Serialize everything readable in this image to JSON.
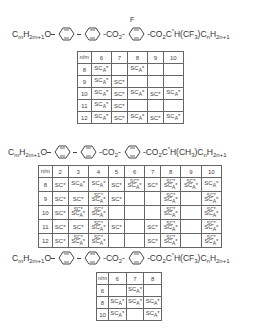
{
  "structures": [
    {
      "id": "compound-1",
      "left_group": "CmH2m+1O",
      "linker": "CO2",
      "lateral_substituent": "F",
      "right_group": "CO2C*H(CF3)CnH2n+1",
      "rings": [
        "phenyl",
        "phenyl",
        "phenyl",
        "fluorophenyl"
      ],
      "table": {
        "corner": "n / m",
        "columns": [
          "6",
          "7",
          "8",
          "9",
          "10"
        ],
        "rows": [
          {
            "m": "8",
            "cells": [
              "SCA*",
              "",
              "SCA*",
              "",
              ""
            ]
          },
          {
            "m": "9",
            "cells": [
              "SCA*",
              "SC*",
              "",
              "",
              ""
            ]
          },
          {
            "m": "10",
            "cells": [
              "SCA*",
              "SC*",
              "SCA*",
              "SC*",
              "SCA*"
            ]
          },
          {
            "m": "11",
            "cells": [
              "SCA*",
              "SC*",
              "",
              "",
              ""
            ]
          },
          {
            "m": "12",
            "cells": [
              "SCA*",
              "SC*",
              "SCA*",
              "SC*",
              "SCA*"
            ]
          }
        ]
      }
    },
    {
      "id": "compound-2",
      "left_group": "CmH2m+1O",
      "linker": "CO2",
      "right_group": "CO2C*H(CH3)CnH2n+1",
      "rings": [
        "phenyl",
        "phenyl",
        "phenyl"
      ],
      "table": {
        "corner": "n / m",
        "columns": [
          "2",
          "3",
          "4",
          "5",
          "6",
          "7",
          "8",
          "9",
          "10"
        ],
        "rows": [
          {
            "m": "8",
            "cells": [
              "SC*",
              "SCA*",
              "SCA*",
              "SC*",
              "SC* SCA*",
              "SC*",
              "SC* SCA*",
              "SC* SCA*",
              "SCA*"
            ]
          },
          {
            "m": "9",
            "cells": [
              "SC*",
              "SC*",
              "SC* SCA*",
              "SC*",
              "",
              "",
              "SC* SCA*",
              "",
              "SC* SCA*"
            ]
          },
          {
            "m": "10",
            "cells": [
              "SC*",
              "SC* SCA*",
              "SC* SCA*",
              "",
              "",
              "",
              "SC* SCA*",
              "",
              "SC* SCA*"
            ]
          },
          {
            "m": "11",
            "cells": [
              "SC*",
              "SC*",
              "SC* SCA*",
              "SC*",
              "",
              "SC*",
              "SC* SCA*",
              "",
              "SC* SCA*"
            ]
          },
          {
            "m": "12",
            "cells": [
              "SC*",
              "SC* SCA*",
              "SC* SCA*",
              "",
              "",
              "SC*",
              "SC* SCA*",
              "",
              "SC* SCA*"
            ]
          }
        ]
      }
    },
    {
      "id": "compound-3",
      "left_group": "CmH2m+1O",
      "linker": "CO2",
      "right_group": "CO2C*H(CF3)CnH2n+1",
      "rings": [
        "phenyl",
        "phenyl",
        "phenyl"
      ],
      "table": {
        "corner": "n / m",
        "columns": [
          "6",
          "7",
          "8"
        ],
        "rows": [
          {
            "m": "6",
            "cells": [
              "",
              "SCA*",
              ""
            ]
          },
          {
            "m": "8",
            "cells": [
              "SCA*",
              "SCA*",
              "SCA*"
            ]
          },
          {
            "m": "10",
            "cells": [
              "SCA*",
              "",
              "SCA*"
            ]
          }
        ]
      }
    }
  ]
}
